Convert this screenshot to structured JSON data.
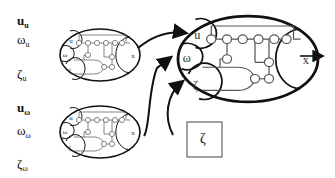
{
  "input_labels": [
    {
      "symbol": "u",
      "subscript": "u",
      "bold": true
    },
    {
      "symbol": "ω",
      "subscript": "u",
      "bold": false
    },
    {
      "symbol": "ζ",
      "subscript": "u",
      "bold": false
    },
    {
      "symbol": "u",
      "subscript": "ω",
      "bold": true
    },
    {
      "symbol": "ω",
      "subscript": "ω",
      "bold": false
    },
    {
      "symbol": "ζ",
      "subscript": "ω",
      "bold": false
    }
  ],
  "modules": {
    "top_left": {
      "inputs": [
        "u",
        "ω",
        "ζ"
      ],
      "output": "X"
    },
    "bottom_left": {
      "inputs": [
        "u",
        "ω",
        "ζ"
      ],
      "output": "X"
    },
    "main": {
      "inputs": [
        "u",
        "ω",
        "ζ"
      ],
      "output": "X"
    }
  },
  "zeta_box": {
    "label": "ζ"
  },
  "colors": {
    "stroke": "#111111",
    "node_stroke": "#555555",
    "background": "#ffffff"
  }
}
